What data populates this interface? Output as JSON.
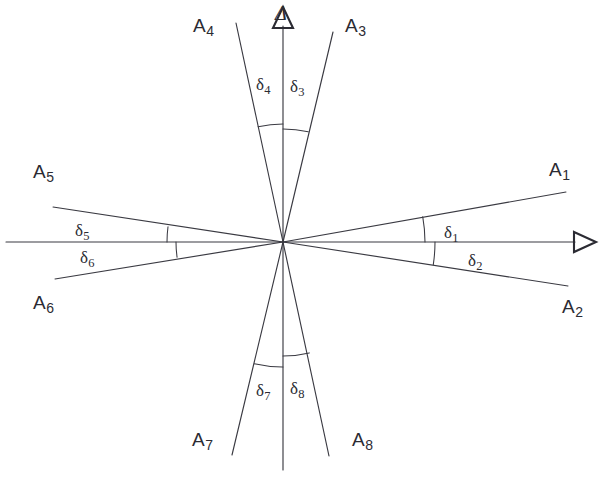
{
  "figure": {
    "background_color": "#ffffff",
    "line_color": "#3a3a42",
    "text_color": "#2b2b33",
    "origin": {
      "x": 283,
      "y": 242
    }
  },
  "axes": {
    "horizontal": {
      "name": "horizontal-axis",
      "label": "",
      "arrow_symbol": "triangle-right",
      "from": {
        "x": 6,
        "y": 242
      },
      "to": {
        "x": 575,
        "y": 242
      },
      "arrow_at": {
        "x": 590,
        "y": 242
      }
    },
    "vertical": {
      "name": "vertical-axis",
      "label": "Δ",
      "label_pos": {
        "x": 275,
        "y": 4
      },
      "arrow_symbol": "triangle-up",
      "from": {
        "x": 283,
        "y": 470
      },
      "to": {
        "x": 283,
        "y": 26
      },
      "arrow_at": {
        "x": 283,
        "y": 11
      }
    }
  },
  "rays": [
    {
      "id": "A1",
      "label": "A",
      "subscript": "1",
      "angle_deg": 10.2,
      "end": {
        "x": 566,
        "y": 192
      },
      "label_pos": {
        "x": 549,
        "y": 160
      }
    },
    {
      "id": "A2",
      "label": "A",
      "subscript": "2",
      "angle_deg": -8.6,
      "end": {
        "x": 568,
        "y": 286
      },
      "label_pos": {
        "x": 562,
        "y": 297
      }
    },
    {
      "id": "A3",
      "label": "A",
      "subscript": "3",
      "angle_deg": 77.1,
      "end": {
        "x": 333,
        "y": 32
      },
      "label_pos": {
        "x": 345,
        "y": 16
      }
    },
    {
      "id": "A4",
      "label": "A",
      "subscript": "4",
      "angle_deg": 102.2,
      "end": {
        "x": 236,
        "y": 23
      },
      "label_pos": {
        "x": 193,
        "y": 16
      }
    },
    {
      "id": "A5",
      "label": "A",
      "subscript": "5",
      "angle_deg": 172.4,
      "end": {
        "x": 53,
        "y": 207
      },
      "label_pos": {
        "x": 33,
        "y": 162
      }
    },
    {
      "id": "A6",
      "label": "A",
      "subscript": "6",
      "angle_deg": 188.2,
      "end": {
        "x": 55,
        "y": 279
      },
      "label_pos": {
        "x": 33,
        "y": 293
      }
    },
    {
      "id": "A7",
      "label": "A",
      "subscript": "7",
      "angle_deg": 256.9,
      "end": {
        "x": 232,
        "y": 455
      },
      "label_pos": {
        "x": 192,
        "y": 430
      }
    },
    {
      "id": "A8",
      "label": "A",
      "subscript": "8",
      "angle_deg": 283.3,
      "end": {
        "x": 329,
        "y": 456
      },
      "label_pos": {
        "x": 352,
        "y": 430
      }
    }
  ],
  "angle_marks": [
    {
      "id": "d1",
      "label": "δ",
      "subscript": "1",
      "between": [
        "horizontal-axis-positive",
        "A1"
      ],
      "arc_radius": 142,
      "start_deg": 0,
      "end_deg": 10.2,
      "label_pos": {
        "x": 444,
        "y": 224
      }
    },
    {
      "id": "d2",
      "label": "δ",
      "subscript": "2",
      "between": [
        "horizontal-axis-positive",
        "A2"
      ],
      "arc_radius": 152,
      "start_deg": -8.6,
      "end_deg": 0,
      "label_pos": {
        "x": 468,
        "y": 252
      }
    },
    {
      "id": "d3",
      "label": "δ",
      "subscript": "3",
      "between": [
        "vertical-axis-positive",
        "A3"
      ],
      "arc_radius": 113,
      "start_deg": 77.1,
      "end_deg": 90,
      "label_pos": {
        "x": 290,
        "y": 78
      }
    },
    {
      "id": "d4",
      "label": "δ",
      "subscript": "4",
      "between": [
        "vertical-axis-positive",
        "A4"
      ],
      "arc_radius": 118,
      "start_deg": 90,
      "end_deg": 102.2,
      "label_pos": {
        "x": 256,
        "y": 76
      }
    },
    {
      "id": "d5",
      "label": "δ",
      "subscript": "5",
      "between": [
        "horizontal-axis-negative",
        "A5"
      ],
      "arc_radius": 116,
      "start_deg": 172.4,
      "end_deg": 180,
      "label_pos": {
        "x": 75,
        "y": 222
      }
    },
    {
      "id": "d6",
      "label": "δ",
      "subscript": "6",
      "between": [
        "horizontal-axis-negative",
        "A6"
      ],
      "arc_radius": 107,
      "start_deg": 180,
      "end_deg": 188.2,
      "label_pos": {
        "x": 80,
        "y": 249
      }
    },
    {
      "id": "d7",
      "label": "δ",
      "subscript": "7",
      "between": [
        "vertical-axis-negative",
        "A7"
      ],
      "arc_radius": 125,
      "start_deg": 256.9,
      "end_deg": 270,
      "label_pos": {
        "x": 256,
        "y": 382
      }
    },
    {
      "id": "d8",
      "label": "δ",
      "subscript": "8",
      "between": [
        "vertical-axis-negative",
        "A8"
      ],
      "arc_radius": 114,
      "start_deg": 270,
      "end_deg": 283.3,
      "label_pos": {
        "x": 290,
        "y": 380
      }
    }
  ],
  "caption": ""
}
